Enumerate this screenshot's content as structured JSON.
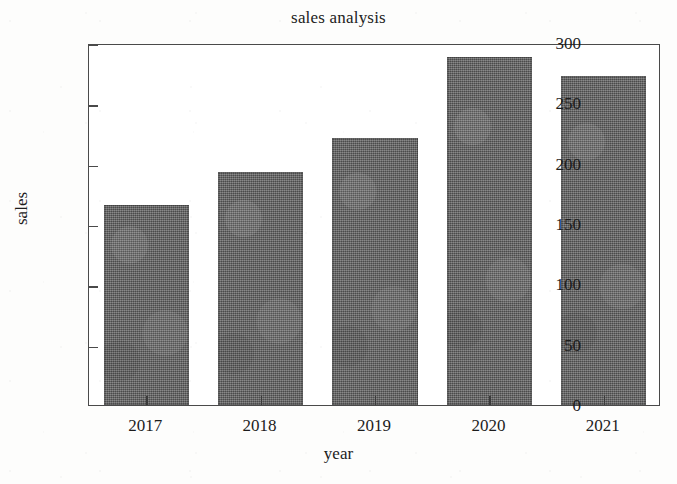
{
  "chart_data": {
    "type": "bar",
    "title": "sales analysis",
    "xlabel": "year",
    "ylabel": "sales",
    "categories": [
      "2017",
      "2018",
      "2019",
      "2020",
      "2021"
    ],
    "values": [
      166,
      193,
      221,
      288,
      273
    ],
    "ylim": [
      0,
      300
    ],
    "yticks": [
      0,
      50,
      100,
      150,
      200,
      250,
      300
    ],
    "ytick_labels": [
      "0",
      "50",
      "100",
      "150",
      "200",
      "250",
      "300"
    ],
    "xtick_labels": [
      "2017",
      "2018",
      "2019",
      "2020",
      "2021"
    ],
    "grid": false,
    "legend": null,
    "bar_color": "#5b5b5b",
    "frame_color": "#4a4a4a",
    "background": "#ffffff"
  }
}
